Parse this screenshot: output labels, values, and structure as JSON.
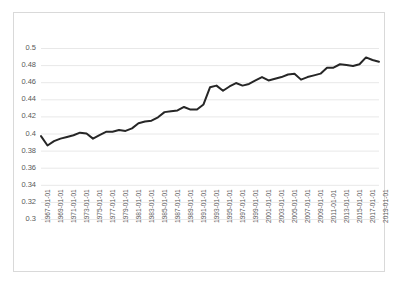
{
  "chart_data": {
    "type": "line",
    "title": "",
    "subtitle": "",
    "xlabel": "",
    "ylabel": "",
    "ylim": [
      0.3,
      0.5
    ],
    "ytick_step": 0.02,
    "ytick_labels": [
      "0.5",
      "0.48",
      "0.46",
      "0.44",
      "0.42",
      "0.4",
      "0.38",
      "0.36",
      "0.34",
      "0.32",
      "0.3"
    ],
    "ytick_values": [
      0.5,
      0.48,
      0.46,
      0.44,
      0.42,
      0.4,
      0.38,
      0.36,
      0.34,
      0.32,
      0.3
    ],
    "grid": "horizontal",
    "legend": "none",
    "line_color": "#262626",
    "line_width": 2,
    "x_tick_interval_years": 2,
    "xtick_labels": [
      "1967-01-01",
      "1969-01-01",
      "1971-01-01",
      "1973-01-01",
      "1975-01-01",
      "1977-01-01",
      "1979-01-01",
      "1981-01-01",
      "1983-01-01",
      "1985-01-01",
      "1987-01-01",
      "1989-01-01",
      "1991-01-01",
      "1993-01-01",
      "1995-01-01",
      "1997-01-01",
      "1999-01-01",
      "2001-01-01",
      "2003-01-01",
      "2005-01-01",
      "2007-01-01",
      "2009-01-01",
      "2011-01-01",
      "2013-01-01",
      "2015-01-01",
      "2017-01-01",
      "2019-01-01"
    ],
    "x": [
      "1967-01-01",
      "1968-01-01",
      "1969-01-01",
      "1970-01-01",
      "1971-01-01",
      "1972-01-01",
      "1973-01-01",
      "1974-01-01",
      "1975-01-01",
      "1976-01-01",
      "1977-01-01",
      "1978-01-01",
      "1979-01-01",
      "1980-01-01",
      "1981-01-01",
      "1982-01-01",
      "1983-01-01",
      "1984-01-01",
      "1985-01-01",
      "1986-01-01",
      "1987-01-01",
      "1988-01-01",
      "1989-01-01",
      "1990-01-01",
      "1991-01-01",
      "1992-01-01",
      "1993-01-01",
      "1994-01-01",
      "1995-01-01",
      "1996-01-01",
      "1997-01-01",
      "1998-01-01",
      "1999-01-01",
      "2000-01-01",
      "2001-01-01",
      "2002-01-01",
      "2003-01-01",
      "2004-01-01",
      "2005-01-01",
      "2006-01-01",
      "2007-01-01",
      "2008-01-01",
      "2009-01-01",
      "2010-01-01",
      "2011-01-01",
      "2012-01-01",
      "2013-01-01",
      "2014-01-01",
      "2015-01-01",
      "2016-01-01",
      "2017-01-01",
      "2018-01-01",
      "2019-01-01"
    ],
    "values": [
      0.397,
      0.386,
      0.391,
      0.394,
      0.396,
      0.398,
      0.401,
      0.4,
      0.394,
      0.398,
      0.402,
      0.402,
      0.404,
      0.403,
      0.406,
      0.412,
      0.414,
      0.415,
      0.419,
      0.425,
      0.426,
      0.427,
      0.431,
      0.428,
      0.428,
      0.434,
      0.454,
      0.456,
      0.45,
      0.455,
      0.459,
      0.456,
      0.458,
      0.462,
      0.466,
      0.462,
      0.464,
      0.466,
      0.469,
      0.47,
      0.463,
      0.466,
      0.468,
      0.47,
      0.477,
      0.477,
      0.481,
      0.48,
      0.479,
      0.481,
      0.489,
      0.486,
      0.484
    ]
  }
}
